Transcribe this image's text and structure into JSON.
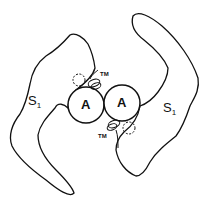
{
  "diagram": {
    "type": "schematic",
    "colors": {
      "line": "#111111",
      "background": "#ffffff"
    },
    "labels": {
      "s1_left": "S",
      "s1_left_sub": "1",
      "s1_right": "S",
      "s1_right_sub": "1",
      "a_left": "A",
      "a_right": "A",
      "tm_top": "TM",
      "tm_bottom": "TM"
    },
    "nodes": [
      {
        "id": "S1-left",
        "shape": "irregular-outline"
      },
      {
        "id": "S1-right",
        "shape": "irregular-outline"
      },
      {
        "id": "A-left",
        "shape": "circle"
      },
      {
        "id": "A-right",
        "shape": "circle"
      },
      {
        "id": "TM-top",
        "shape": "loops"
      },
      {
        "id": "TM-bottom",
        "shape": "loops"
      },
      {
        "id": "dashed-top",
        "shape": "dashed-circle"
      },
      {
        "id": "dashed-bottom",
        "shape": "dashed-circle"
      }
    ]
  }
}
